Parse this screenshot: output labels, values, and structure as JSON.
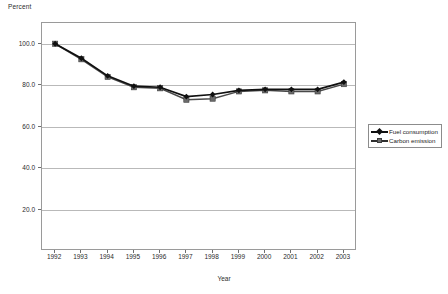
{
  "chart_data": {
    "type": "line",
    "title": "",
    "ylabel": "Percent",
    "xlabel": "Year",
    "categories": [
      "1992",
      "1993",
      "1994",
      "1995",
      "1996",
      "1997",
      "1998",
      "1999",
      "2000",
      "2001",
      "2002",
      "2003"
    ],
    "ytick_labels": [
      "100.0",
      "80.0",
      "60.0",
      "40.0",
      "20.0"
    ],
    "ytick_values": [
      100.0,
      80.0,
      60.0,
      40.0,
      20.0
    ],
    "ylim": [
      0,
      110
    ],
    "xlim": [
      "1992",
      "2003"
    ],
    "grid": "horizontal",
    "legend_position": "right-middle",
    "series": [
      {
        "name": "Fuel consumption",
        "marker": "diamond",
        "color": "#101010",
        "values": [
          100.0,
          93.0,
          84.5,
          79.5,
          79.0,
          74.5,
          75.5,
          77.5,
          78.0,
          78.0,
          78.0,
          81.5
        ]
      },
      {
        "name": "Carbon emission",
        "marker": "square",
        "color": "#6b6b6b",
        "values": [
          100.0,
          92.5,
          84.0,
          79.0,
          78.5,
          73.0,
          73.5,
          77.0,
          77.5,
          77.0,
          77.0,
          80.5
        ]
      }
    ]
  },
  "legend": {
    "items": [
      {
        "label": "Fuel consumption"
      },
      {
        "label": "Carbon emission"
      }
    ]
  },
  "axes": {
    "y_title": "Percent",
    "x_title": "Year"
  }
}
